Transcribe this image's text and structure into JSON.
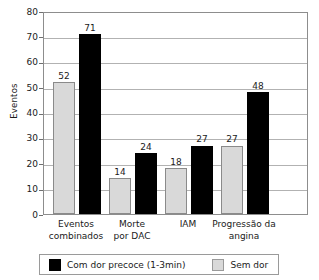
{
  "chart_data": {
    "type": "bar",
    "title": "",
    "xlabel": "",
    "ylabel": "Eventos",
    "ylim": [
      0,
      80
    ],
    "ytick_step": 10,
    "yticks": [
      "80",
      "70",
      "60",
      "50",
      "40",
      "30",
      "20",
      "10",
      "0"
    ],
    "grid": true,
    "legend_position": "bottom",
    "categories": [
      "Eventos combinados",
      "Morte por DAC",
      "IAM",
      "Progressão da angina"
    ],
    "category_lines": [
      [
        "Eventos",
        "combinados"
      ],
      [
        "Morte",
        "por DAC"
      ],
      [
        "IAM",
        ""
      ],
      [
        "Progressão da",
        "angina"
      ]
    ],
    "series": [
      {
        "name": "Sem dor",
        "color": "#d9d9d9",
        "values": [
          52,
          14,
          18,
          27
        ],
        "labels": [
          "52",
          "14",
          "18",
          "27"
        ]
      },
      {
        "name": "Com dor precoce (1-3min)",
        "color": "#000000",
        "values": [
          71,
          24,
          27,
          48
        ],
        "labels": [
          "71",
          "24",
          "27",
          "48"
        ]
      }
    ],
    "legend": [
      {
        "label": "Com dor precoce (1-3min)",
        "color": "#000000"
      },
      {
        "label": "Sem dor",
        "color": "#d9d9d9"
      }
    ]
  }
}
